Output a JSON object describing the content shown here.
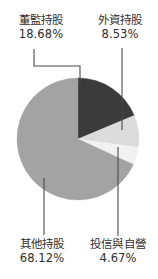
{
  "chart_data": {
    "type": "pie",
    "title": "",
    "subtitle": "",
    "xlabel": "",
    "ylabel": "",
    "legend_position": "none",
    "grid": false,
    "units": "%",
    "start_angle_deg": 0,
    "direction": "clockwise",
    "categories": [
      "董監持股",
      "外資持股",
      "投信與自營",
      "其他持股"
    ],
    "values": [
      18.68,
      8.53,
      4.67,
      68.12
    ],
    "slices": [
      {
        "label": "董監持股",
        "value": 18.68,
        "value_text": "18.68%",
        "color": "#3b3b3b",
        "leader": "elbow-left"
      },
      {
        "label": "外資持股",
        "value": 8.53,
        "value_text": "8.53%",
        "color": "#dcdcdc",
        "leader": "vertical-up"
      },
      {
        "label": "投信與自營",
        "value": 4.67,
        "value_text": "4.67%",
        "color": "#f1f1f1",
        "leader": "vertical-down"
      },
      {
        "label": "其他持股",
        "value": 68.12,
        "value_text": "68.12%",
        "color": "#a3a3a3",
        "leader": "vertical-down"
      }
    ]
  },
  "labels": {
    "directors": {
      "name": "董監持股",
      "value": "18.68%"
    },
    "foreign": {
      "name": "外資持股",
      "value": "8.53%"
    },
    "others": {
      "name": "其他持股",
      "value": "68.12%"
    },
    "investment": {
      "name": "投信與自營",
      "value": "4.67%"
    }
  },
  "colors": {
    "background": "#ffffff",
    "text": "#2f2f2f",
    "leader_line": "#4a4a4a",
    "slice_directors": "#3b3b3b",
    "slice_foreign": "#dcdcdc",
    "slice_investment": "#f1f1f1",
    "slice_others": "#a3a3a3"
  },
  "geometry": {
    "center_x": 78,
    "center_y": 139,
    "radius": 61
  }
}
